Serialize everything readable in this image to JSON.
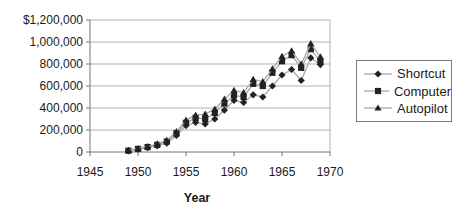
{
  "chart_data": {
    "type": "line",
    "title": "",
    "xlabel": "Year",
    "ylabel": "",
    "xlim": [
      1945,
      1970
    ],
    "ylim": [
      0,
      1200000
    ],
    "grid": true,
    "legend_position": "right",
    "x_ticks": [
      1945,
      1950,
      1955,
      1960,
      1965,
      1970
    ],
    "y_ticks": [
      {
        "value": 1200000,
        "label": "$1,200,000"
      },
      {
        "value": 1000000,
        "label": "1,000,000"
      },
      {
        "value": 800000,
        "label": "800,000"
      },
      {
        "value": 600000,
        "label": "600,000"
      },
      {
        "value": 400000,
        "label": "400,000"
      },
      {
        "value": 200000,
        "label": "200,000"
      },
      {
        "value": 0,
        "label": "0"
      }
    ],
    "x": [
      1949,
      1950,
      1951,
      1952,
      1953,
      1954,
      1955,
      1956,
      1957,
      1958,
      1959,
      1960,
      1961,
      1962,
      1963,
      1964,
      1965,
      1966,
      1967,
      1968,
      1969
    ],
    "series": [
      {
        "name": "Shortcut",
        "marker": "diamond",
        "values": [
          10000,
          25000,
          40000,
          55000,
          80000,
          150000,
          240000,
          270000,
          255000,
          300000,
          380000,
          470000,
          450000,
          520000,
          500000,
          600000,
          700000,
          750000,
          650000,
          855000,
          795000
        ]
      },
      {
        "name": "Computer",
        "marker": "square",
        "values": [
          12000,
          28000,
          45000,
          65000,
          95000,
          170000,
          265000,
          310000,
          300000,
          355000,
          440000,
          515000,
          500000,
          620000,
          600000,
          720000,
          825000,
          880000,
          765000,
          935000,
          825000
        ]
      },
      {
        "name": "Autopilot",
        "marker": "triangle",
        "values": [
          15000,
          32000,
          50000,
          75000,
          105000,
          185000,
          290000,
          335000,
          345000,
          390000,
          480000,
          560000,
          540000,
          660000,
          640000,
          755000,
          870000,
          920000,
          800000,
          985000,
          865000
        ]
      }
    ]
  },
  "colors": {
    "background": "#ffffff",
    "grid": "#b3b3b3",
    "axis": "#777777",
    "text": "#1a1a1a",
    "series_line": "#a8a8a8",
    "series_marker": "#222222",
    "legend_border": "#7a7a7a"
  }
}
